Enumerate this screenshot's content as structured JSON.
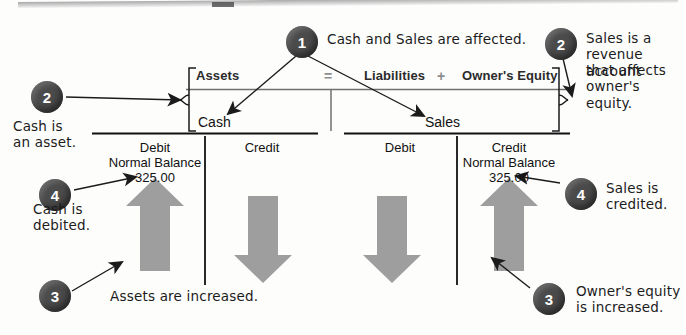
{
  "figure": {
    "equation": {
      "terms": [
        "Assets",
        "Liabilities",
        "Owner's Equity"
      ],
      "operator_equals": "=",
      "operator_plus": "+"
    },
    "accounts": [
      {
        "name": "Cash",
        "debit_label": "Debit",
        "credit_label": "Credit",
        "normal_balance_label": "Normal Balance",
        "normal_balance_side": "debit",
        "amount": "325.00",
        "amount_side": "debit",
        "block_arrow_debit": "up",
        "block_arrow_credit": "down"
      },
      {
        "name": "Sales",
        "debit_label": "Debit",
        "credit_label": "Credit",
        "normal_balance_label": "Normal Balance",
        "normal_balance_side": "credit",
        "amount": "325.00",
        "amount_side": "credit",
        "block_arrow_debit": "down",
        "block_arrow_credit": "up"
      }
    ],
    "callouts": [
      {
        "number": "1",
        "lines": [
          "Cash and Sales are affected."
        ]
      },
      {
        "number": "2",
        "lines": [
          "Cash is",
          "an asset."
        ]
      },
      {
        "number": "2",
        "lines": [
          "Sales is a",
          "revenue account",
          "that affects",
          "owner's equity."
        ]
      },
      {
        "number": "3",
        "lines": [
          "Assets are increased."
        ]
      },
      {
        "number": "3",
        "lines": [
          "Owner's equity",
          "is increased."
        ]
      },
      {
        "number": "4",
        "lines": [
          "Cash is",
          "debited."
        ]
      },
      {
        "number": "4",
        "lines": [
          "Sales is",
          "credited."
        ]
      }
    ],
    "colors": {
      "bubble": "#4b4b4b",
      "block_arrow": "#9e9e9e",
      "rule": "#111111",
      "equation_rule": "#6f6f6f"
    }
  }
}
